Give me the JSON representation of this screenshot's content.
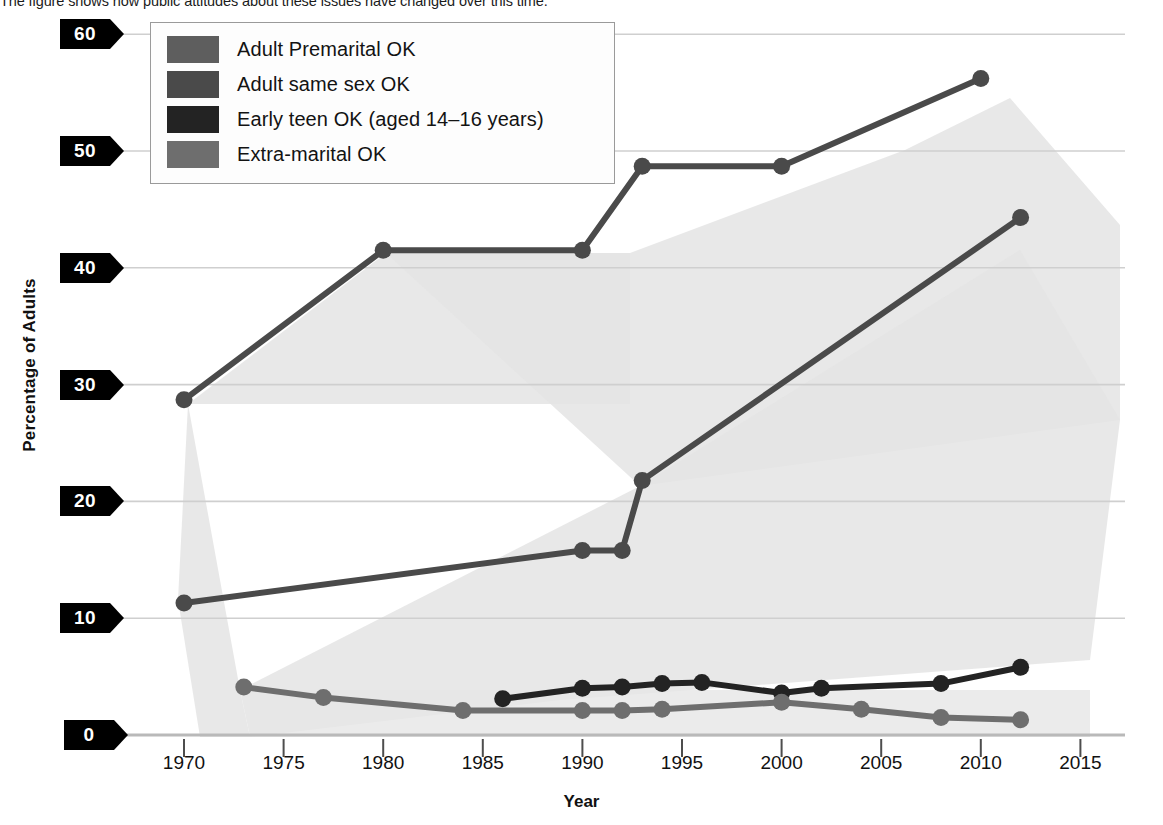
{
  "caption": "The figure shows how public attitudes about these issues have changed over this time.",
  "axis": {
    "ylabel": "Percentage of Adults",
    "xlabel": "Year",
    "yticks": [
      "60",
      "50",
      "40",
      "30",
      "20",
      "10",
      "0"
    ],
    "xticks": [
      "1970",
      "1975",
      "1980",
      "1985",
      "1990",
      "1995",
      "2000",
      "2005",
      "2010",
      "2015"
    ]
  },
  "legend": {
    "items": [
      {
        "label": "Adult Premarital OK",
        "color": "#5e5e5e"
      },
      {
        "label": "Adult same sex OK",
        "color": "#4a4a4a"
      },
      {
        "label": "Early teen OK (aged 14–16 years)",
        "color": "#232323"
      },
      {
        "label": "Extra-marital  OK",
        "color": "#6e6e6e"
      }
    ]
  },
  "chart_data": {
    "type": "line",
    "title": "",
    "xlabel": "Year",
    "ylabel": "Percentage of Adults",
    "xlim": [
      1967,
      2017
    ],
    "ylim": [
      0,
      62
    ],
    "yticks": [
      0,
      10,
      20,
      30,
      40,
      50,
      60
    ],
    "xticks": [
      1970,
      1975,
      1980,
      1985,
      1990,
      1995,
      2000,
      2005,
      2010,
      2015
    ],
    "grid": "horizontal",
    "legend_position": "top-left",
    "series": [
      {
        "name": "Adult Premarital OK",
        "color": "#4a4a4a",
        "x": [
          1970,
          1980,
          1990,
          1993,
          2000,
          2010
        ],
        "values": [
          28.7,
          41.5,
          41.5,
          48.7,
          48.7,
          56.2
        ]
      },
      {
        "name": "Adult same sex OK",
        "color": "#4a4a4a",
        "x": [
          1970,
          1990,
          1992,
          1993,
          2012
        ],
        "values": [
          11.3,
          15.8,
          15.8,
          21.8,
          44.3
        ]
      },
      {
        "name": "Early teen OK (aged 14–16 years)",
        "color": "#232323",
        "x": [
          1986,
          1990,
          1992,
          1994,
          1996,
          2000,
          2002,
          2008,
          2012
        ],
        "values": [
          3.1,
          4.0,
          4.1,
          4.4,
          4.5,
          3.6,
          4.0,
          4.4,
          5.8
        ]
      },
      {
        "name": "Extra-marital  OK",
        "color": "#6e6e6e",
        "x": [
          1973,
          1977,
          1984,
          1990,
          1992,
          1994,
          2000,
          2004,
          2008,
          2012
        ],
        "values": [
          4.1,
          3.2,
          2.1,
          2.1,
          2.1,
          2.2,
          2.8,
          2.2,
          1.5,
          1.3
        ]
      }
    ]
  }
}
